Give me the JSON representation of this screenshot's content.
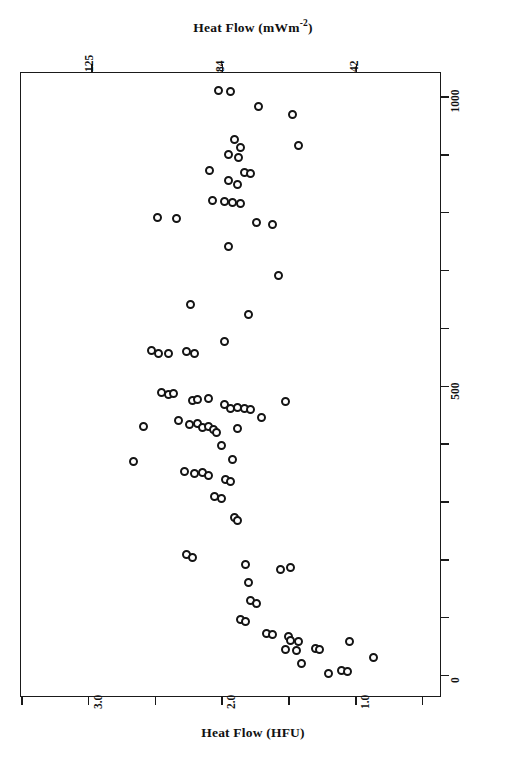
{
  "figure": {
    "top_axis": {
      "title_main": "Heat Flow (mWm",
      "title_sup": "-2",
      "title_close": ")",
      "title_full": "Heat Flow (mWm-2)",
      "ticks": [
        {
          "label": "125",
          "value": 125,
          "x_frac": 0.2375
        },
        {
          "label": "",
          "value": 105,
          "x_frac": 0.4804
        },
        {
          "label": "84",
          "value": 84,
          "x_frac": 0.4804
        },
        {
          "label": "42",
          "value": 42,
          "x_frac": 0.7316
        }
      ],
      "tick_labels": [
        "125",
        "84",
        "42"
      ]
    },
    "bottom_axis": {
      "title": "Heat Flow (HFU)",
      "major_ticks": [
        {
          "label": "3.0",
          "value": 3.0,
          "x_frac": 0.2613
        },
        {
          "label": "2.0",
          "value": 2.0,
          "x_frac": 0.4988
        },
        {
          "label": "1.0",
          "value": 1.0,
          "x_frac": 0.7363
        }
      ],
      "minor_ticks": [
        {
          "label": "",
          "value": 3.5,
          "x_frac": 0.1425
        },
        {
          "label": "",
          "value": 2.5,
          "x_frac": 0.38
        },
        {
          "label": "",
          "value": 1.5,
          "x_frac": 0.6175
        },
        {
          "label": "",
          "value": 0.5,
          "x_frac": 0.855
        }
      ],
      "tick_labels": [
        "3.0",
        "2.0",
        "1.0"
      ]
    },
    "right_axis": {
      "title": "Distance from the Mendocino Triple Junction  (km)",
      "ticks": [
        {
          "label": "1000",
          "value": 1000,
          "y_frac": 0.0368
        },
        {
          "label": "",
          "value": 900,
          "y_frac": 0.1304
        },
        {
          "label": "",
          "value": 800,
          "y_frac": 0.224
        },
        {
          "label": "",
          "value": 700,
          "y_frac": 0.3176
        },
        {
          "label": "",
          "value": 600,
          "y_frac": 0.4112
        },
        {
          "label": "500",
          "value": 500,
          "y_frac": 0.5048
        },
        {
          "label": "",
          "value": 400,
          "y_frac": 0.5984
        },
        {
          "label": "",
          "value": 300,
          "y_frac": 0.692
        },
        {
          "label": "",
          "value": 200,
          "y_frac": 0.7856
        },
        {
          "label": "",
          "value": 100,
          "y_frac": 0.8792
        },
        {
          "label": "0",
          "value": 0,
          "y_frac": 0.9728
        }
      ],
      "tick_labels": [
        "1000",
        "500",
        "0"
      ]
    },
    "regions": [
      {
        "name": "mojave-region",
        "label": "Mojave Region",
        "label_x": 104,
        "label_y": 220
      },
      {
        "name": "california-coast-ranges",
        "label": "California Coast Ranges",
        "label_x": 104,
        "label_y": 530,
        "arrow": {
          "x": 104,
          "y_top": 253,
          "y_bottom": 650,
          "double_headed": true
        }
      }
    ],
    "colors": {
      "ink": "#141414",
      "frame": "#1a1a1a",
      "marker_fill": "#ffffff",
      "background": "#ffffff"
    }
  },
  "chart_data": {
    "type": "scatter",
    "title": "",
    "xlabel": "Heat Flow (HFU)",
    "ylabel": "Distance from the Mendocino Triple Junction (km)",
    "x2label": "Heat Flow (mWm-2)",
    "orientation": "x-axis reversed (heat flow decreases left to right)",
    "grid": false,
    "legend": null,
    "xlim": [
      3.5,
      0.35
    ],
    "ylim": [
      -40,
      1040
    ],
    "x2lim": [
      147,
      15
    ],
    "xticks": [
      3.5,
      3.0,
      2.5,
      2.0,
      1.5,
      1.0,
      0.5
    ],
    "x2ticks": [
      125,
      84,
      42
    ],
    "yticks": [
      0,
      100,
      200,
      300,
      400,
      500,
      600,
      700,
      800,
      900,
      1000
    ],
    "marker": "open-circle",
    "point_count": 92,
    "xunit": "HFU",
    "yunit": "km",
    "points": [
      {
        "x": 2.02,
        "y": 1010
      },
      {
        "x": 1.93,
        "y": 1008
      },
      {
        "x": 1.72,
        "y": 982
      },
      {
        "x": 1.47,
        "y": 968
      },
      {
        "x": 1.9,
        "y": 925
      },
      {
        "x": 1.86,
        "y": 912
      },
      {
        "x": 1.42,
        "y": 914
      },
      {
        "x": 1.95,
        "y": 900
      },
      {
        "x": 1.87,
        "y": 894
      },
      {
        "x": 2.09,
        "y": 872
      },
      {
        "x": 1.83,
        "y": 868
      },
      {
        "x": 1.78,
        "y": 866
      },
      {
        "x": 1.95,
        "y": 855
      },
      {
        "x": 1.88,
        "y": 848
      },
      {
        "x": 2.07,
        "y": 820
      },
      {
        "x": 1.98,
        "y": 818
      },
      {
        "x": 1.92,
        "y": 816
      },
      {
        "x": 1.86,
        "y": 814
      },
      {
        "x": 2.48,
        "y": 790
      },
      {
        "x": 2.34,
        "y": 788
      },
      {
        "x": 1.74,
        "y": 782
      },
      {
        "x": 1.62,
        "y": 778
      },
      {
        "x": 1.95,
        "y": 740
      },
      {
        "x": 1.57,
        "y": 690
      },
      {
        "x": 2.23,
        "y": 640
      },
      {
        "x": 1.8,
        "y": 622
      },
      {
        "x": 2.52,
        "y": 560
      },
      {
        "x": 2.47,
        "y": 556
      },
      {
        "x": 2.4,
        "y": 556
      },
      {
        "x": 2.26,
        "y": 558
      },
      {
        "x": 2.2,
        "y": 556
      },
      {
        "x": 1.98,
        "y": 576
      },
      {
        "x": 2.45,
        "y": 488
      },
      {
        "x": 2.4,
        "y": 484
      },
      {
        "x": 2.36,
        "y": 486
      },
      {
        "x": 2.22,
        "y": 474
      },
      {
        "x": 2.18,
        "y": 476
      },
      {
        "x": 2.1,
        "y": 478
      },
      {
        "x": 1.98,
        "y": 468
      },
      {
        "x": 1.93,
        "y": 460
      },
      {
        "x": 1.88,
        "y": 462
      },
      {
        "x": 1.83,
        "y": 460
      },
      {
        "x": 1.78,
        "y": 458
      },
      {
        "x": 1.52,
        "y": 472
      },
      {
        "x": 2.32,
        "y": 440
      },
      {
        "x": 2.24,
        "y": 432
      },
      {
        "x": 2.18,
        "y": 434
      },
      {
        "x": 2.14,
        "y": 428
      },
      {
        "x": 2.1,
        "y": 430
      },
      {
        "x": 2.06,
        "y": 424
      },
      {
        "x": 2.04,
        "y": 418
      },
      {
        "x": 1.88,
        "y": 426
      },
      {
        "x": 1.7,
        "y": 444
      },
      {
        "x": 2.58,
        "y": 430
      },
      {
        "x": 2.0,
        "y": 396
      },
      {
        "x": 1.92,
        "y": 372
      },
      {
        "x": 2.66,
        "y": 368
      },
      {
        "x": 2.28,
        "y": 352
      },
      {
        "x": 2.2,
        "y": 348
      },
      {
        "x": 2.14,
        "y": 350
      },
      {
        "x": 2.1,
        "y": 344
      },
      {
        "x": 1.97,
        "y": 338
      },
      {
        "x": 1.93,
        "y": 334
      },
      {
        "x": 2.05,
        "y": 308
      },
      {
        "x": 2.0,
        "y": 304
      },
      {
        "x": 1.9,
        "y": 272
      },
      {
        "x": 1.88,
        "y": 266
      },
      {
        "x": 2.26,
        "y": 208
      },
      {
        "x": 2.22,
        "y": 202
      },
      {
        "x": 1.82,
        "y": 190
      },
      {
        "x": 1.56,
        "y": 182
      },
      {
        "x": 1.48,
        "y": 186
      },
      {
        "x": 1.8,
        "y": 160
      },
      {
        "x": 1.78,
        "y": 128
      },
      {
        "x": 1.74,
        "y": 124
      },
      {
        "x": 1.86,
        "y": 96
      },
      {
        "x": 1.82,
        "y": 92
      },
      {
        "x": 1.66,
        "y": 72
      },
      {
        "x": 1.62,
        "y": 70
      },
      {
        "x": 1.5,
        "y": 66
      },
      {
        "x": 1.48,
        "y": 60
      },
      {
        "x": 1.42,
        "y": 58
      },
      {
        "x": 1.52,
        "y": 44
      },
      {
        "x": 1.44,
        "y": 42
      },
      {
        "x": 1.3,
        "y": 46
      },
      {
        "x": 1.27,
        "y": 44
      },
      {
        "x": 1.04,
        "y": 58
      },
      {
        "x": 1.4,
        "y": 20
      },
      {
        "x": 1.2,
        "y": 2
      },
      {
        "x": 1.1,
        "y": 8
      },
      {
        "x": 1.06,
        "y": 6
      },
      {
        "x": 0.86,
        "y": 30
      }
    ]
  }
}
